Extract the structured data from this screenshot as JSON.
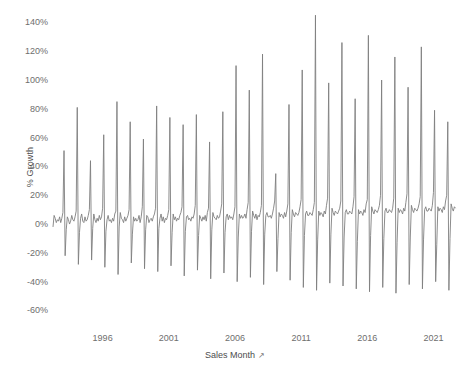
{
  "chart_data": {
    "type": "line",
    "title": "",
    "subtitle": "",
    "xlabel": "Sales Month",
    "ylabel": "% Growth",
    "xlabel_icon": "sort-ascending-icon",
    "grid": false,
    "legend": "none",
    "line_color": "#7f7f7f",
    "background_color": "#ffffff",
    "ylim": [
      -68,
      150
    ],
    "ytick_labels": [
      "140%",
      "120%",
      "100%",
      "80%",
      "60%",
      "40%",
      "20%",
      "0%",
      "-20%",
      "-40%",
      "-60%"
    ],
    "ytick_values": [
      140,
      120,
      100,
      80,
      60,
      40,
      20,
      0,
      -20,
      -40,
      -60
    ],
    "xlim": [
      1992.25,
      2022.25
    ],
    "xtick_labels": [
      "1996",
      "2001",
      "2006",
      "2011",
      "2016",
      "2021"
    ],
    "xtick_values": [
      1996,
      2001,
      2006,
      2011,
      2016,
      2021
    ],
    "x_unit": "year",
    "series_name": "% Growth",
    "x_start": 1992.25,
    "x_step_months": 1,
    "values": [
      -2,
      6,
      4,
      1,
      3,
      2,
      5,
      1,
      4,
      8,
      51,
      -22,
      -4,
      5,
      3,
      0,
      2,
      6,
      3,
      2,
      5,
      9,
      81,
      -28,
      -6,
      4,
      7,
      2,
      1,
      5,
      2,
      3,
      6,
      10,
      44,
      -25,
      -3,
      7,
      3,
      1,
      4,
      2,
      6,
      3,
      5,
      11,
      62,
      -30,
      -5,
      3,
      6,
      2,
      3,
      1,
      4,
      2,
      7,
      9,
      85,
      -35,
      -2,
      8,
      4,
      3,
      1,
      5,
      2,
      4,
      6,
      10,
      71,
      -27,
      -7,
      5,
      2,
      4,
      2,
      3,
      6,
      1,
      5,
      12,
      59,
      -31,
      -4,
      6,
      5,
      1,
      3,
      4,
      2,
      5,
      7,
      11,
      82,
      -33,
      -3,
      4,
      7,
      2,
      5,
      1,
      4,
      3,
      6,
      10,
      74,
      -29,
      -6,
      7,
      3,
      5,
      2,
      4,
      3,
      6,
      8,
      12,
      69,
      -36,
      -5,
      5,
      6,
      3,
      4,
      2,
      5,
      4,
      7,
      13,
      76,
      -32,
      -8,
      6,
      4,
      2,
      5,
      3,
      6,
      2,
      8,
      11,
      57,
      -38,
      -4,
      8,
      5,
      4,
      3,
      6,
      4,
      5,
      9,
      14,
      78,
      -34,
      -6,
      5,
      7,
      3,
      6,
      4,
      5,
      3,
      7,
      12,
      110,
      -40,
      -9,
      7,
      4,
      6,
      4,
      5,
      7,
      4,
      10,
      15,
      93,
      -37,
      -5,
      9,
      6,
      4,
      7,
      3,
      6,
      5,
      8,
      13,
      118,
      -42,
      -7,
      6,
      8,
      5,
      5,
      6,
      4,
      7,
      11,
      16,
      35,
      -33,
      -10,
      8,
      5,
      7,
      6,
      4,
      8,
      5,
      9,
      14,
      83,
      -39,
      -6,
      10,
      7,
      5,
      8,
      7,
      6,
      8,
      12,
      17,
      107,
      -44,
      -8,
      7,
      9,
      6,
      6,
      8,
      7,
      6,
      10,
      15,
      145,
      -46,
      -11,
      9,
      6,
      8,
      7,
      5,
      9,
      7,
      13,
      18,
      98,
      -41,
      -7,
      11,
      8,
      6,
      9,
      8,
      7,
      9,
      11,
      16,
      126,
      -43,
      -9,
      8,
      10,
      7,
      7,
      9,
      8,
      7,
      12,
      19,
      87,
      -45,
      -12,
      10,
      7,
      9,
      8,
      6,
      10,
      8,
      14,
      17,
      131,
      -47,
      -8,
      12,
      9,
      7,
      10,
      9,
      8,
      10,
      13,
      20,
      100,
      -44,
      -10,
      9,
      11,
      8,
      8,
      10,
      9,
      8,
      11,
      18,
      116,
      -48,
      -13,
      11,
      8,
      10,
      9,
      7,
      11,
      9,
      15,
      21,
      95,
      -42,
      -9,
      13,
      10,
      8,
      11,
      10,
      9,
      11,
      14,
      19,
      123,
      -45,
      -11,
      10,
      12,
      9,
      9,
      11,
      10,
      9,
      13,
      22,
      79,
      -40,
      -14,
      12,
      9,
      11,
      10,
      8,
      12,
      10,
      16,
      20,
      71,
      -46,
      -10,
      14,
      11,
      9,
      12,
      11
    ],
    "annotations": {
      "peak_value": 145,
      "peak_period": "2011",
      "trough_value": -48,
      "series_description": "Monthly sales growth with strong December spikes and January troughs"
    }
  },
  "axes": {
    "y_title": "% Growth",
    "x_title": "Sales Month"
  }
}
